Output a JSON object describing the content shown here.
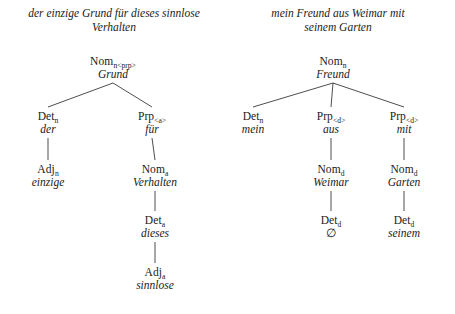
{
  "figure": {
    "trees": [
      {
        "id": "tree-left",
        "caption": "der einzige Grund für dieses sinnlose Verhalten",
        "caption_line1": "der einzige Grund für dieses sinnlose",
        "caption_line2": "Verhalten",
        "nodes": [
          {
            "id": "l-root",
            "category": "Nom",
            "subscript": "n<prp>",
            "word": "Grund",
            "x": 113,
            "y": 55
          },
          {
            "id": "l-det",
            "category": "Det",
            "subscript": "n",
            "word": "der",
            "x": 48,
            "y": 110
          },
          {
            "id": "l-prp",
            "category": "Prp",
            "subscript": "<a>",
            "word": "für",
            "x": 152,
            "y": 110
          },
          {
            "id": "l-adj",
            "category": "Adj",
            "subscript": "n",
            "word": "einzige",
            "x": 48,
            "y": 163
          },
          {
            "id": "l-nom-a",
            "category": "Nom",
            "subscript": "a",
            "word": "Verhalten",
            "x": 155,
            "y": 163
          },
          {
            "id": "l-det-a",
            "category": "Det",
            "subscript": "a",
            "word": "dieses",
            "x": 155,
            "y": 214
          },
          {
            "id": "l-adj-a",
            "category": "Adj",
            "subscript": "a",
            "word": "sinnlose",
            "x": 155,
            "y": 266
          }
        ],
        "edges": [
          {
            "from": "l-root",
            "to": "l-det"
          },
          {
            "from": "l-root",
            "to": "l-prp"
          },
          {
            "from": "l-det",
            "to": "l-adj"
          },
          {
            "from": "l-prp",
            "to": "l-nom-a"
          },
          {
            "from": "l-nom-a",
            "to": "l-det-a"
          },
          {
            "from": "l-det-a",
            "to": "l-adj-a"
          }
        ]
      },
      {
        "id": "tree-right",
        "caption": "mein Freund aus Weimar mit seinem Garten",
        "caption_line1": "mein Freund aus Weimar mit",
        "caption_line2": "seinem Garten",
        "nodes": [
          {
            "id": "r-root",
            "category": "Nom",
            "subscript": "n",
            "word": "Freund",
            "x": 333,
            "y": 55
          },
          {
            "id": "r-det",
            "category": "Det",
            "subscript": "n",
            "word": "mein",
            "x": 253,
            "y": 110
          },
          {
            "id": "r-prp-aus",
            "category": "Prp",
            "subscript": "<d>",
            "word": "aus",
            "x": 331,
            "y": 110
          },
          {
            "id": "r-prp-mit",
            "category": "Prp",
            "subscript": "<d>",
            "word": "mit",
            "x": 404,
            "y": 110
          },
          {
            "id": "r-nom-weimar",
            "category": "Nom",
            "subscript": "d",
            "word": "Weimar",
            "x": 331,
            "y": 163
          },
          {
            "id": "r-nom-garten",
            "category": "Nom",
            "subscript": "d",
            "word": "Garten",
            "x": 404,
            "y": 163
          },
          {
            "id": "r-det-null",
            "category": "Det",
            "subscript": "d",
            "word": "∅",
            "x": 331,
            "y": 214
          },
          {
            "id": "r-det-seinem",
            "category": "Det",
            "subscript": "d",
            "word": "seinem",
            "x": 404,
            "y": 214
          }
        ],
        "edges": [
          {
            "from": "r-root",
            "to": "r-det"
          },
          {
            "from": "r-root",
            "to": "r-prp-aus"
          },
          {
            "from": "r-root",
            "to": "r-prp-mit"
          },
          {
            "from": "r-prp-aus",
            "to": "r-nom-weimar"
          },
          {
            "from": "r-prp-mit",
            "to": "r-nom-garten"
          },
          {
            "from": "r-nom-weimar",
            "to": "r-det-null"
          },
          {
            "from": "r-nom-garten",
            "to": "r-det-seinem"
          }
        ]
      }
    ],
    "colors": {
      "ink": "#1a1a1a",
      "line": "#3a3a3a",
      "background": "#ffffff"
    }
  }
}
